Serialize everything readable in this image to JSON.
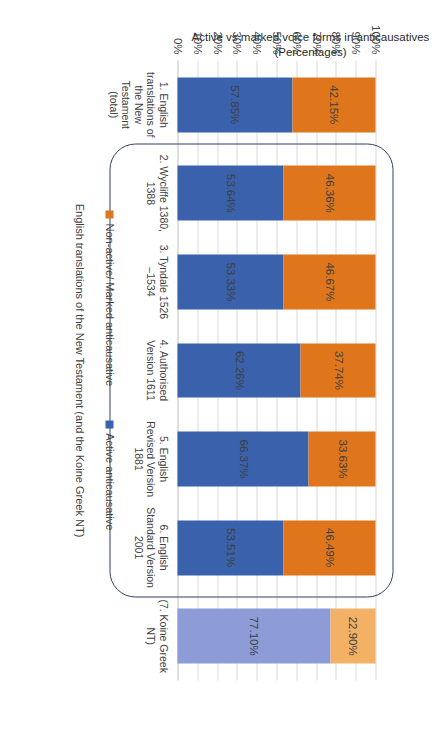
{
  "page": {
    "artifact_mark": "···"
  },
  "chart_data": {
    "type": "bar",
    "subtype": "stacked-bar-100",
    "orientation": "vertical-rendered-rotated-90ccw",
    "title": "",
    "xlabel": "English translations of the New Testament (and the Koine Greek NT)",
    "ylabel": "Active vs marked voice forms in anticausatives (Percentages)",
    "ylim": [
      0,
      100
    ],
    "ytick_labels": [
      "0%",
      "10%",
      "20%",
      "30%",
      "40%",
      "50%",
      "60%",
      "70%",
      "80%",
      "90%",
      "100%"
    ],
    "ytick_values": [
      0,
      10,
      20,
      30,
      40,
      50,
      60,
      70,
      80,
      90,
      100
    ],
    "grid": true,
    "legend_position": "bottom",
    "categories": [
      "1. English translations of the New Testament (total)",
      "2. Wycliffe 1380, 1388 <M3>",
      "3. Tyndale 1526 –1534  <E1>",
      "4. Authorised Version 1611 <E2>",
      "5. English Revised Version 1881 <B3>",
      "6. English Standard Version 2001",
      "(7. Koine Greek NT)"
    ],
    "category_lines": [
      [
        "1. English",
        "translations of",
        "the New",
        "Testament",
        "(total)"
      ],
      [
        "2. Wycliffe 1380,",
        "1388 <M3>"
      ],
      [
        "3. Tyndale  1526",
        "–1534",
        "<E1>"
      ],
      [
        "4. Authorised",
        "Version 1611",
        "<E2>"
      ],
      [
        "5. English",
        "Revised Version",
        "1881 <B3>"
      ],
      [
        "6. English",
        "Standard Version",
        "2001"
      ],
      [
        "(7. Koine Greek",
        "NT)"
      ]
    ],
    "series": [
      {
        "name": "Active anticausative",
        "color": "#3A62AC",
        "color_highlight": "#8D9BD6",
        "values": [
          57.85,
          53.64,
          53.33,
          62.26,
          66.37,
          53.51,
          77.1
        ],
        "labels": [
          "57.85%",
          "53.64%",
          "53.33%",
          "62.26%",
          "66.37%",
          "53.51%",
          "77.10%"
        ]
      },
      {
        "name": "Non-active/ Marked anticausative",
        "color": "#E0761C",
        "color_highlight": "#F2B165",
        "values": [
          42.15,
          46.36,
          46.67,
          37.74,
          33.63,
          46.49,
          22.9
        ],
        "labels": [
          "42.15%",
          "46.36%",
          "46.67%",
          "37.74%",
          "33.63%",
          "46.49%",
          "22.90%"
        ]
      }
    ],
    "highlight_categories": [
      1,
      2,
      3,
      4,
      5
    ],
    "annotation": {
      "shape": "rounded-rectangle",
      "color": "#2F3F66",
      "encloses": "categories 2 through 6"
    }
  },
  "legend": {
    "items": [
      {
        "label": "Non-active/ Marked anticausative",
        "color": "#E0761C"
      },
      {
        "label": "Active anticausative",
        "color": "#3A62AC"
      }
    ]
  }
}
